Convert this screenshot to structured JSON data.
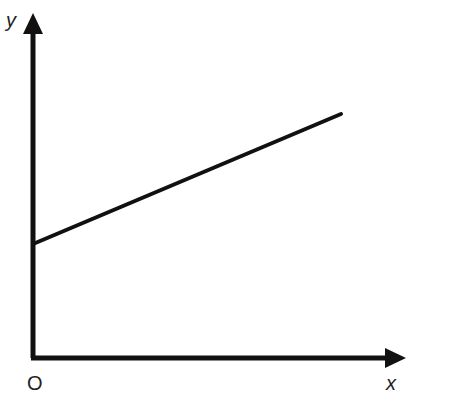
{
  "diagram": {
    "type": "line-graph-sketch",
    "axes": {
      "x_label": "x",
      "y_label": "y",
      "origin_label": "O"
    },
    "line": {
      "description": "straight line with positive slope and positive y-intercept",
      "start": {
        "x": 33,
        "y": 244
      },
      "end": {
        "x": 341,
        "y": 114
      }
    },
    "colors": {
      "stroke": "#111111",
      "background": "#ffffff"
    }
  }
}
